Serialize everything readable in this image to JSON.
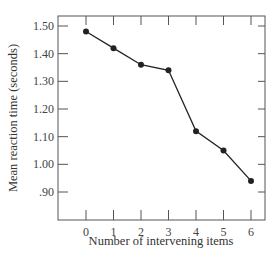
{
  "chart_data": {
    "type": "line",
    "title": "",
    "xlabel": "Number of intervening items",
    "ylabel": "Mean reaction time (seconds)",
    "x": [
      0,
      1,
      2,
      3,
      4,
      5,
      6
    ],
    "x_tick_labels": [
      "0",
      "1",
      "2",
      "3",
      "4",
      "5",
      "6"
    ],
    "y_tick_values": [
      1.5,
      1.4,
      1.3,
      1.2,
      1.1,
      1.0,
      0.9
    ],
    "y_tick_labels": [
      "1.50",
      "1.40",
      "1.30",
      "1.20",
      "1.10",
      "1.00",
      ".90"
    ],
    "series": [
      {
        "name": "Mean reaction time",
        "values": [
          1.48,
          1.42,
          1.36,
          1.34,
          1.12,
          1.05,
          0.94
        ],
        "marker": "circle",
        "color": "#222222"
      }
    ],
    "xlim": [
      -1,
      6.5
    ],
    "ylim": [
      0.8,
      1.54
    ],
    "grid": false,
    "legend": null
  }
}
